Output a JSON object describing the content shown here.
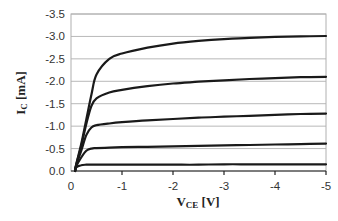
{
  "chart_data": {
    "type": "line",
    "title": "",
    "xlabel": "V_CE [V]",
    "xlabel_main": "V",
    "xlabel_sub": "CE",
    "xlabel_unit": " [V]",
    "ylabel": "I_C [mA]",
    "ylabel_main": "I",
    "ylabel_sub": "C",
    "ylabel_unit": " [mA]",
    "xlim": [
      0,
      -5
    ],
    "ylim": [
      0,
      -3.5
    ],
    "x_ticks": [
      "0",
      "-1",
      "-2",
      "-3",
      "-4",
      "-5"
    ],
    "y_ticks": [
      "0.0",
      "-0.5",
      "-1.0",
      "-1.5",
      "-2.0",
      "-2.5",
      "-3.0",
      "-3.5"
    ],
    "grid": "horizontal",
    "legend": null,
    "x": [
      0,
      -0.1,
      -0.2,
      -0.3,
      -0.4,
      -0.5,
      -0.75,
      -1,
      -1.5,
      -2,
      -2.5,
      -3,
      -3.5,
      -4,
      -4.5,
      -5
    ],
    "series": [
      {
        "name": "curve 1",
        "values": [
          0,
          -0.08,
          -0.13,
          -0.14,
          -0.14,
          -0.14,
          -0.14,
          -0.14,
          -0.14,
          -0.14,
          -0.14,
          -0.15,
          -0.15,
          -0.15,
          -0.15,
          -0.15
        ]
      },
      {
        "name": "curve 2",
        "values": [
          0,
          -0.1,
          -0.3,
          -0.45,
          -0.5,
          -0.51,
          -0.52,
          -0.53,
          -0.54,
          -0.55,
          -0.56,
          -0.57,
          -0.58,
          -0.59,
          -0.6,
          -0.61
        ]
      },
      {
        "name": "curve 3",
        "values": [
          0,
          -0.12,
          -0.45,
          -0.8,
          -0.97,
          -1.02,
          -1.06,
          -1.09,
          -1.13,
          -1.16,
          -1.19,
          -1.21,
          -1.23,
          -1.25,
          -1.27,
          -1.28
        ]
      },
      {
        "name": "curve 4",
        "values": [
          0,
          -0.13,
          -0.55,
          -1.05,
          -1.45,
          -1.62,
          -1.75,
          -1.81,
          -1.89,
          -1.95,
          -1.99,
          -2.02,
          -2.05,
          -2.07,
          -2.09,
          -2.1
        ]
      },
      {
        "name": "curve 5",
        "values": [
          0,
          -0.14,
          -0.6,
          -1.15,
          -1.7,
          -2.15,
          -2.5,
          -2.62,
          -2.75,
          -2.84,
          -2.9,
          -2.94,
          -2.97,
          -2.99,
          -3.0,
          -3.01
        ]
      }
    ]
  }
}
